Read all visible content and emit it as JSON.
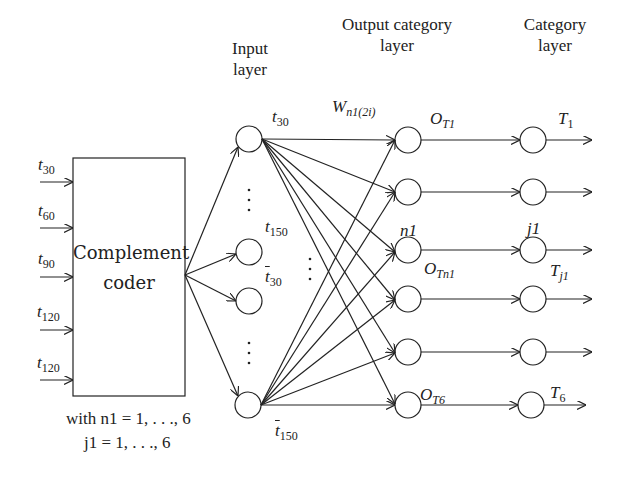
{
  "headers": {
    "input_layer": [
      "Input",
      "layer"
    ],
    "output_category_layer": [
      "Output category",
      "layer"
    ],
    "category_layer": [
      "Category",
      "layer"
    ]
  },
  "coder": {
    "label_line1": "Complement",
    "label_line2": "coder",
    "inputs": [
      {
        "base": "t",
        "sub": "30"
      },
      {
        "base": "t",
        "sub": "60"
      },
      {
        "base": "t",
        "sub": "90"
      },
      {
        "base": "t",
        "sub": "120"
      },
      {
        "base": "t",
        "sub": "120"
      }
    ]
  },
  "input_nodes": [
    {
      "base": "t",
      "sub": "30",
      "bar": false
    },
    {
      "base": "t",
      "sub": "150",
      "bar": false
    },
    {
      "base": "t",
      "sub": "30",
      "bar": true
    },
    {
      "base": "t",
      "sub": "150",
      "bar": true
    }
  ],
  "weight_label": {
    "base": "W",
    "sub": "n1(2i)"
  },
  "output_labels": {
    "top": {
      "base": "O",
      "sub": "T1"
    },
    "middle_index": "n1",
    "middle": {
      "base": "O",
      "sub": "Tn1"
    },
    "bottom": {
      "base": "O",
      "sub": "T6"
    }
  },
  "category_labels": {
    "top": {
      "base": "T",
      "sub": "1"
    },
    "middle_index": "j1",
    "middle": {
      "base": "T",
      "sub": "j1"
    },
    "bottom": {
      "base": "T",
      "sub": "6"
    }
  },
  "ellipsis": "⋮",
  "notes": {
    "line1": "with n1 = 1, . . ., 6",
    "line2": "j1 = 1, . . ., 6"
  },
  "colors": {
    "stroke": "#222222",
    "background": "#ffffff"
  }
}
